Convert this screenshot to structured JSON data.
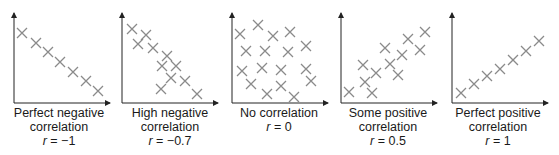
{
  "figure": {
    "marker_color": "#8a8a8a",
    "axis_color": "#222222",
    "marker": "cross",
    "panels": [
      {
        "id": "perfect-negative",
        "title_line1": "Perfect negative",
        "title_line2": "correlation",
        "r_label": "r",
        "r_equals": " = ",
        "r_value": "−1",
        "origin_x": 14,
        "points": [
          [
            22,
            33
          ],
          [
            36,
            43
          ],
          [
            48,
            52
          ],
          [
            60,
            62
          ],
          [
            73,
            72
          ],
          [
            86,
            81
          ],
          [
            98,
            91
          ]
        ]
      },
      {
        "id": "high-negative",
        "title_line1": "High negative",
        "title_line2": "correlation",
        "r_label": "r",
        "r_equals": " = ",
        "r_value": "−0.7",
        "origin_x": 122,
        "points": [
          [
            132,
            29
          ],
          [
            146,
            35
          ],
          [
            138,
            44
          ],
          [
            153,
            48
          ],
          [
            167,
            56
          ],
          [
            162,
            66
          ],
          [
            176,
            66
          ],
          [
            171,
            78
          ],
          [
            185,
            81
          ],
          [
            161,
            89
          ],
          [
            197,
            94
          ]
        ]
      },
      {
        "id": "no-correlation",
        "title_line1": "No correlation",
        "title_line2": "",
        "r_label": "r",
        "r_equals": " = ",
        "r_value": "0",
        "origin_x": 232,
        "points": [
          [
            240,
            34
          ],
          [
            258,
            25
          ],
          [
            273,
            36
          ],
          [
            290,
            32
          ],
          [
            246,
            51
          ],
          [
            265,
            51
          ],
          [
            288,
            52
          ],
          [
            306,
            46
          ],
          [
            242,
            71
          ],
          [
            262,
            68
          ],
          [
            281,
            70
          ],
          [
            306,
            69
          ],
          [
            251,
            84
          ],
          [
            281,
            86
          ],
          [
            311,
            81
          ],
          [
            267,
            94
          ],
          [
            294,
            97
          ]
        ]
      },
      {
        "id": "some-positive",
        "title_line1": "Some positive",
        "title_line2": "correlation",
        "r_label": "r",
        "r_equals": " = ",
        "r_value": "0.5",
        "origin_x": 341,
        "points": [
          [
            349,
            92
          ],
          [
            365,
            82
          ],
          [
            372,
            93
          ],
          [
            363,
            65
          ],
          [
            376,
            73
          ],
          [
            385,
            48
          ],
          [
            390,
            64
          ],
          [
            398,
            75
          ],
          [
            402,
            55
          ],
          [
            408,
            39
          ],
          [
            420,
            50
          ],
          [
            425,
            32
          ]
        ]
      },
      {
        "id": "perfect-positive",
        "title_line1": "Perfect positive",
        "title_line2": "correlation",
        "r_label": "r",
        "r_equals": " = ",
        "r_value": "1",
        "origin_x": 452,
        "points": [
          [
            461,
            93
          ],
          [
            474,
            84
          ],
          [
            487,
            76
          ],
          [
            500,
            69
          ],
          [
            513,
            60
          ],
          [
            526,
            51
          ],
          [
            539,
            41
          ]
        ]
      }
    ]
  },
  "chart_data": {
    "type": "scatter",
    "xlabel": "",
    "ylabel": "",
    "grid": false,
    "legend": "none",
    "panels": [
      {
        "label": "Perfect negative correlation",
        "r": -1,
        "trend": "negative-linear",
        "n_points": 7
      },
      {
        "label": "High negative correlation",
        "r": -0.7,
        "trend": "negative",
        "n_points": 11
      },
      {
        "label": "No correlation",
        "r": 0,
        "trend": "none",
        "n_points": 17
      },
      {
        "label": "Some positive correlation",
        "r": 0.5,
        "trend": "positive",
        "n_points": 12
      },
      {
        "label": "Perfect positive correlation",
        "r": 1,
        "trend": "positive-linear",
        "n_points": 7
      }
    ]
  }
}
